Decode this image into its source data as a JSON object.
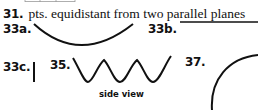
{
  "answers": {
    "q31": {
      "number": "31.",
      "text": "pts. equidistant from two parallel planes"
    },
    "q33a": {
      "number": "33a.",
      "figure": "downward-arc"
    },
    "q33b": {
      "number": "33b.",
      "figure": "horizontal-line"
    },
    "q33c": {
      "number": "33c.",
      "figure": "vertical-line"
    },
    "q35": {
      "number": "35.",
      "figure": "wave",
      "caption": "side view"
    },
    "q37": {
      "number": "37.",
      "figure": "circle-arc"
    }
  },
  "colors": {
    "ink": "#111111",
    "background": "#ffffff"
  }
}
